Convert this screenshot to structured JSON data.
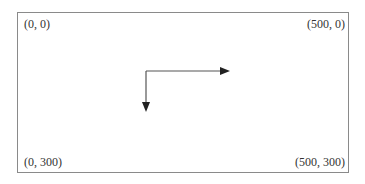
{
  "diagram": {
    "corners": {
      "top_left": "(0, 0)",
      "top_right": "(500, 0)",
      "bottom_left": "(0, 300)",
      "bottom_right": "(500, 300)"
    },
    "axes": [
      {
        "name": "x-axis",
        "direction": "right"
      },
      {
        "name": "y-axis",
        "direction": "down"
      }
    ],
    "colors": {
      "border": "#8a8a8a",
      "arrow": "#222222",
      "text": "#333333"
    }
  }
}
